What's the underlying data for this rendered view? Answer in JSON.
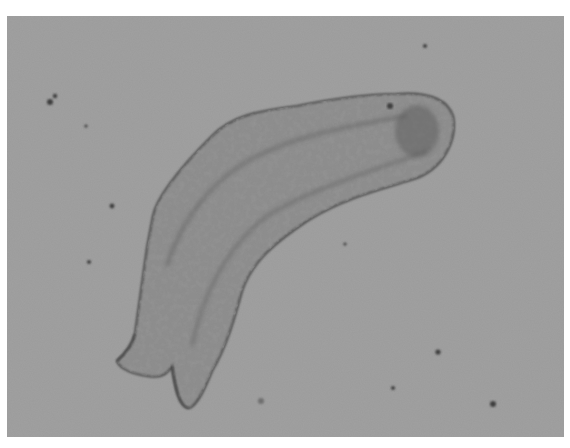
{
  "image": {
    "kind": "brightfield micrograph (grayscale)",
    "subject": "elongated multicellular specimen with granular texture, curved body, rounded head at upper right and forked tail at lower left",
    "colors": {
      "background": "#9b9b9b",
      "border": "#ffffff",
      "specimen_fill": "#8e8e8e",
      "specimen_outline": "#4a4a4a",
      "granules": "#5a5a5a",
      "debris": "#3e3e3e"
    }
  }
}
